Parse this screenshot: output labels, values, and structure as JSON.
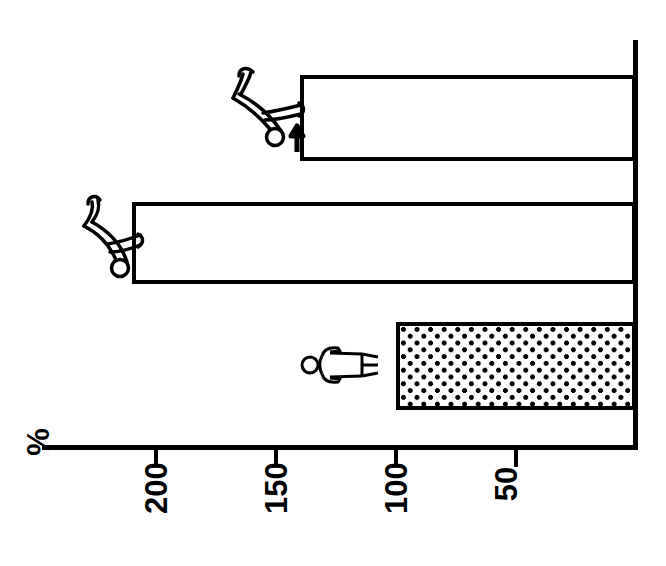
{
  "chart_data": {
    "type": "bar",
    "orientation": "horizontal-rotated-90",
    "title": "",
    "subtitle": "",
    "xlabel": "",
    "ylabel": "%",
    "axis_unit_label": "%",
    "categories": [
      "lifting-with-bent-back",
      "lifting-with-straight-back",
      "standing-upright"
    ],
    "values": [
      140,
      210,
      100
    ],
    "tick_labels": [
      "200",
      "150",
      "100",
      "50"
    ],
    "tick_values": [
      200,
      150,
      100,
      50
    ],
    "axis_range": [
      0,
      230
    ],
    "grid": false,
    "legend": false,
    "bar_styles": [
      "outline",
      "outline",
      "dotted-fill"
    ],
    "annotations": [
      {
        "name": "arrow-marker",
        "target_bar": 0,
        "symbol": "→"
      }
    ]
  },
  "axis": {
    "unit_label": "%",
    "ticks": [
      {
        "label": "200",
        "value": 200
      },
      {
        "label": "150",
        "value": 150
      },
      {
        "label": "100",
        "value": 100
      },
      {
        "label": "50",
        "value": 50
      }
    ]
  },
  "bars": [
    {
      "id": "bar-lifting-bent-back",
      "label": "",
      "value": 140,
      "style": "outline",
      "icon": "person-lifting-bent-back-icon",
      "has_arrow": true
    },
    {
      "id": "bar-lifting-straight-back",
      "label": "",
      "value": 210,
      "style": "outline",
      "icon": "person-lifting-straight-back-icon",
      "has_arrow": false
    },
    {
      "id": "bar-standing-upright",
      "label": "",
      "value": 100,
      "style": "dotted-fill",
      "icon": "person-standing-icon",
      "has_arrow": false
    }
  ],
  "colors": {
    "line": "#000000",
    "background": "#ffffff",
    "fill_dots": "#000000"
  }
}
